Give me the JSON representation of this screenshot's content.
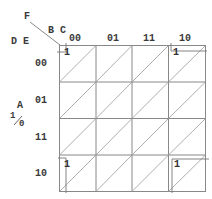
{
  "diagram": {
    "type": "karnaugh-map",
    "variables": {
      "corner_top": "F",
      "columns_var": "B C",
      "rows_var": "D E",
      "side_var": "A",
      "side_values": "1/0",
      "side_value_top": "1",
      "side_value_bottom": "0"
    },
    "column_headers": [
      "00",
      "01",
      "11",
      "10"
    ],
    "row_headers": [
      "00",
      "01",
      "11",
      "10"
    ],
    "cells": [
      [
        "1",
        "",
        "",
        "1"
      ],
      [
        "",
        "",
        "",
        ""
      ],
      [
        "",
        "",
        "",
        ""
      ],
      [
        "1",
        "",
        "",
        "1"
      ]
    ],
    "line_color": "#8a8a8a",
    "text_color": "#3a3a3a"
  }
}
